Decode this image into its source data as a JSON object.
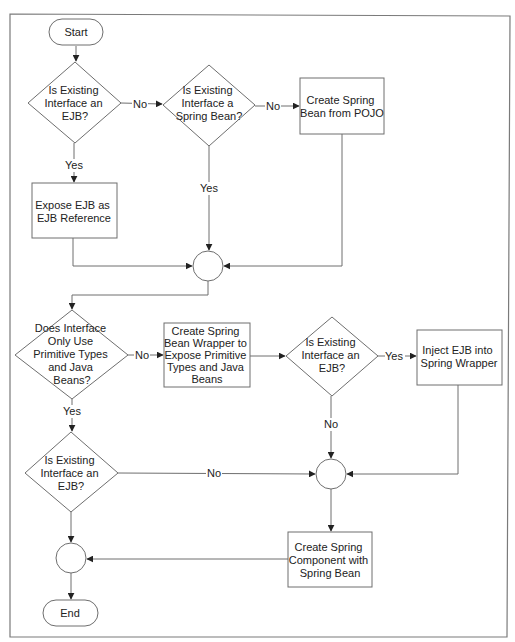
{
  "diagram": {
    "type": "flowchart",
    "nodes": {
      "start": {
        "kind": "terminator",
        "label": [
          "Start"
        ]
      },
      "d1": {
        "kind": "decision",
        "label": [
          "Is Existing",
          "Interface an",
          "EJB?"
        ]
      },
      "d2": {
        "kind": "decision",
        "label": [
          "Is Existing",
          "Interface a",
          "Spring Bean?"
        ]
      },
      "p_pojo": {
        "kind": "process",
        "label": [
          "Create Spring",
          "Bean from POJO"
        ]
      },
      "p_expose": {
        "kind": "process",
        "label": [
          "Expose EJB as",
          "EJB Reference"
        ]
      },
      "m1": {
        "kind": "merge",
        "label": []
      },
      "d3": {
        "kind": "decision",
        "label": [
          "Does Interface",
          "Only Use",
          "Primitive Types",
          "and Java",
          "Beans?"
        ]
      },
      "p_wrapper": {
        "kind": "process",
        "label": [
          "Create Spring",
          "Bean Wrapper to",
          "Expose Primitive",
          "Types and Java",
          "Beans"
        ]
      },
      "d4": {
        "kind": "decision",
        "label": [
          "Is Existing",
          "Interface an",
          "EJB?"
        ]
      },
      "p_inject": {
        "kind": "process",
        "label": [
          "Inject EJB into",
          "Spring Wrapper"
        ]
      },
      "d5": {
        "kind": "decision",
        "label": [
          "Is Existing",
          "Interface an",
          "EJB?"
        ]
      },
      "m2": {
        "kind": "merge",
        "label": []
      },
      "p_component": {
        "kind": "process",
        "label": [
          "Create Spring",
          "Component with",
          "Spring Bean"
        ]
      },
      "m3": {
        "kind": "merge",
        "label": []
      },
      "end": {
        "kind": "terminator",
        "label": [
          "End"
        ]
      }
    },
    "edges": [
      {
        "from": "start",
        "to": "d1",
        "label": ""
      },
      {
        "from": "d1",
        "to": "d2",
        "label": "No"
      },
      {
        "from": "d1",
        "to": "p_expose",
        "label": "Yes"
      },
      {
        "from": "d2",
        "to": "p_pojo",
        "label": "No"
      },
      {
        "from": "d2",
        "to": "m1",
        "label": "Yes"
      },
      {
        "from": "p_expose",
        "to": "m1",
        "label": ""
      },
      {
        "from": "p_pojo",
        "to": "m1",
        "label": ""
      },
      {
        "from": "m1",
        "to": "d3",
        "label": ""
      },
      {
        "from": "d3",
        "to": "p_wrapper",
        "label": "No"
      },
      {
        "from": "d3",
        "to": "d5",
        "label": "Yes"
      },
      {
        "from": "p_wrapper",
        "to": "d4",
        "label": ""
      },
      {
        "from": "d4",
        "to": "p_inject",
        "label": "Yes"
      },
      {
        "from": "d4",
        "to": "m2",
        "label": "No"
      },
      {
        "from": "p_inject",
        "to": "m2",
        "label": ""
      },
      {
        "from": "d5",
        "to": "m2",
        "label": "No"
      },
      {
        "from": "d5",
        "to": "m3",
        "label": ""
      },
      {
        "from": "m2",
        "to": "p_component",
        "label": ""
      },
      {
        "from": "p_component",
        "to": "m3",
        "label": ""
      },
      {
        "from": "m3",
        "to": "end",
        "label": ""
      }
    ],
    "edge_labels": {
      "d1_no": "No",
      "d1_yes": "Yes",
      "d2_no": "No",
      "d2_yes": "Yes",
      "d3_no": "No",
      "d3_yes": "Yes",
      "d4_yes": "Yes",
      "d4_no": "No",
      "d5_no": "No"
    },
    "colors": {
      "stroke": "#6e6e6e",
      "text": "#222222",
      "background": "#ffffff"
    }
  }
}
